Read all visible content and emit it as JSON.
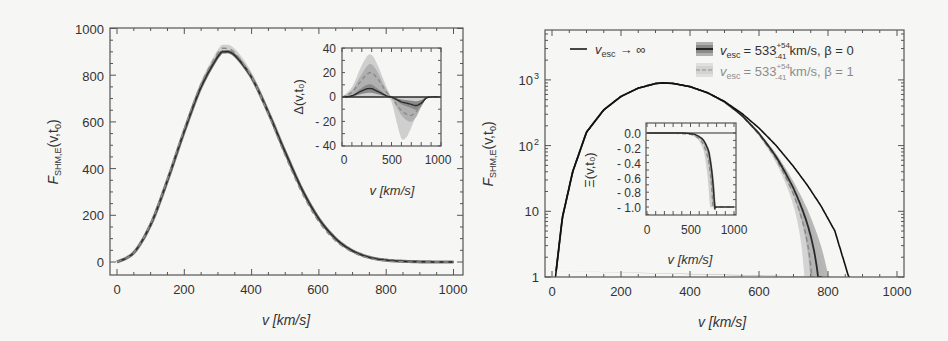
{
  "chart_data": [
    {
      "type": "line",
      "panel": "left",
      "title": "",
      "xlabel": "v [km/s]",
      "ylabel": "F_SHM,E(v,t0)",
      "xlim": [
        -20,
        1030
      ],
      "ylim": [
        -55,
        1000
      ],
      "xticks": [
        0,
        200,
        400,
        600,
        800,
        1000
      ],
      "yticks": [
        0,
        200,
        400,
        600,
        800,
        1000
      ],
      "grid": false,
      "x": [
        0,
        50,
        100,
        150,
        200,
        250,
        300,
        320,
        350,
        400,
        450,
        500,
        550,
        600,
        650,
        700,
        750,
        800,
        850,
        900,
        950,
        1000
      ],
      "series": [
        {
          "name": "v_esc -> inf",
          "style": "solid-dark",
          "values": [
            0,
            40,
            160,
            350,
            560,
            750,
            880,
            900,
            885,
            790,
            640,
            470,
            310,
            185,
            100,
            48,
            20,
            8,
            3,
            1,
            0,
            0
          ]
        },
        {
          "name": "v_esc = 533 km/s, beta = 0 (band)",
          "style": "band-dark",
          "values": [
            0,
            40,
            162,
            354,
            566,
            758,
            890,
            910,
            893,
            795,
            640,
            465,
            303,
            178,
            94,
            44,
            17,
            5,
            1,
            0,
            0,
            0
          ]
        },
        {
          "name": "v_esc = 533 km/s, beta = 1 (dashed)",
          "style": "dashed-light",
          "values": [
            0,
            40,
            163,
            356,
            570,
            763,
            895,
            915,
            896,
            793,
            633,
            455,
            295,
            172,
            90,
            42,
            16,
            4,
            1,
            0,
            0,
            0
          ]
        }
      ],
      "inset": {
        "xlabel": "v [km/s]",
        "ylabel": "Δ(v,t0)",
        "xlim": [
          0,
          1000
        ],
        "ylim": [
          -40,
          40
        ],
        "xticks": [
          0,
          500,
          1000
        ],
        "yticks": [
          -40,
          -20,
          0,
          20,
          40
        ],
        "x": [
          0,
          100,
          200,
          280,
          350,
          450,
          500,
          550,
          600,
          650,
          700,
          750,
          800,
          850,
          900,
          1000
        ],
        "series": [
          {
            "name": "solid beta=0",
            "values": [
              0,
              1,
              5,
              7,
              5,
              1,
              0,
              -2,
              -4,
              -5,
              -6,
              -7,
              -5,
              -1,
              0,
              0
            ]
          },
          {
            "name": "dashed beta=1",
            "values": [
              0,
              4,
              14,
              20,
              16,
              4,
              0,
              -6,
              -11,
              -14,
              -15,
              -12,
              -6,
              -1,
              0,
              0
            ]
          },
          {
            "name": "band upper",
            "values": [
              0,
              8,
              26,
              35,
              28,
              8,
              0,
              0,
              0,
              0,
              0,
              0,
              0,
              0,
              0,
              0
            ]
          },
          {
            "name": "band lower",
            "values": [
              0,
              0,
              0,
              0,
              0,
              0,
              -4,
              -20,
              -34,
              -33,
              -25,
              -15,
              -6,
              -1,
              0,
              0
            ]
          }
        ]
      }
    },
    {
      "type": "line",
      "panel": "right",
      "xlabel": "v [km/s]",
      "ylabel": "F_SHM,E(v,t0)",
      "yscale": "log",
      "xlim": [
        -20,
        1020
      ],
      "ylim": [
        1,
        5800
      ],
      "xticks": [
        0,
        200,
        400,
        600,
        800,
        1000
      ],
      "yticks": [
        "1",
        "10",
        "10²",
        "10³"
      ],
      "legend": [
        {
          "label": "v_esc → ∞",
          "style": "solid-black"
        },
        {
          "label": "v_esc = 533 (+54/-41) km/s, β = 0",
          "style": "band-dark"
        },
        {
          "label": "v_esc = 533 (+54/-41) km/s, β = 1",
          "style": "band-light-dashed"
        }
      ],
      "x": [
        10,
        30,
        60,
        100,
        150,
        200,
        250,
        300,
        320,
        350,
        400,
        450,
        500,
        550,
        600,
        650,
        700,
        740,
        780,
        820,
        860
      ],
      "series": [
        {
          "name": "v_esc -> inf",
          "values": [
            1,
            8,
            40,
            160,
            350,
            560,
            750,
            880,
            900,
            885,
            790,
            640,
            470,
            310,
            185,
            100,
            48,
            25,
            12,
            5,
            1
          ]
        },
        {
          "name": "beta=0 median",
          "values": [
            1,
            8,
            40,
            160,
            350,
            560,
            750,
            880,
            900,
            885,
            790,
            640,
            465,
            300,
            170,
            85,
            35,
            12,
            1,
            null,
            null
          ]
        },
        {
          "name": "beta=1 median",
          "values": [
            1,
            8,
            40,
            160,
            350,
            560,
            750,
            880,
            900,
            885,
            790,
            635,
            455,
            290,
            160,
            75,
            28,
            7,
            null,
            null,
            null
          ]
        }
      ],
      "inset": {
        "xlabel": "v [km/s]",
        "ylabel": "Ξ(v,t0)",
        "xlim": [
          0,
          1000
        ],
        "ylim": [
          -1.05,
          0.1
        ],
        "xticks": [
          0,
          500,
          1000
        ],
        "yticks": [
          "0.0",
          "-0.2",
          "-0.4",
          "-0.6",
          "-0.8",
          "-1.0"
        ],
        "x": [
          0,
          200,
          400,
          500,
          550,
          600,
          650,
          700,
          720,
          740,
          760,
          780,
          800,
          1000
        ],
        "series": [
          {
            "name": "solid beta=0",
            "values": [
              0,
              0,
              0,
              -0.01,
              -0.02,
              -0.05,
              -0.1,
              -0.22,
              -0.32,
              -0.48,
              -0.7,
              -1.0,
              -1.0,
              -1.0
            ]
          },
          {
            "name": "dashed beta=1",
            "values": [
              0,
              0,
              -0.01,
              -0.02,
              -0.04,
              -0.08,
              -0.16,
              -0.34,
              -0.48,
              -0.7,
              -1.0,
              -1.0,
              -1.0,
              -1.0
            ]
          }
        ]
      }
    }
  ],
  "labels": {
    "left": {
      "xlabel": "v [km/s]",
      "ylabel_main": "F",
      "ylabel_sub": "SHM,E",
      "ylabel_args": "(v,t",
      "ylabel_argsub": "0",
      "ylabel_close": ")",
      "xticks": [
        "0",
        "200",
        "400",
        "600",
        "800",
        "1000"
      ],
      "yticks": [
        "0",
        "200",
        "400",
        "600",
        "800",
        "1000"
      ],
      "inset_xlabel": "v [km/s]",
      "inset_ylabel": "Δ(v,t₀)",
      "inset_xticks": [
        "0",
        "500",
        "1000"
      ],
      "inset_yticks": [
        "40",
        "20",
        "0",
        "- 20",
        "- 40"
      ]
    },
    "right": {
      "xlabel": "v [km/s]",
      "xticks": [
        "0",
        "200",
        "400",
        "600",
        "800",
        "1000"
      ],
      "yticks": [
        "1",
        "10",
        "10",
        "10"
      ],
      "yticks_exp": [
        "",
        "",
        "2",
        "3"
      ],
      "inset_xlabel": "v [km/s]",
      "inset_ylabel": "Ξ(v,t₀)",
      "inset_xticks": [
        "0",
        "500",
        "1000"
      ],
      "inset_yticks": [
        "0.0",
        "- 0.2",
        "- 0.4",
        "- 0.6",
        "- 0.8",
        "- 1.0"
      ],
      "legend_inf_v": "v",
      "legend_inf_sub": "esc",
      "legend_inf_rest": "→ ∞",
      "legend_b0_v": "v",
      "legend_b0_sub": "esc",
      "legend_b0_eq": "= 533",
      "legend_b0_sup": "+54",
      "legend_b0_lo": "-41",
      "legend_b0_rest": "km/s, β = 0",
      "legend_b1_v": "v",
      "legend_b1_sub": "esc",
      "legend_b1_eq": "= 533",
      "legend_b1_sup": "+54",
      "legend_b1_lo": "-41",
      "legend_b1_rest": "km/s, β = 1"
    }
  },
  "colors": {
    "dark": "#2a2a2a",
    "band_dark": "#8a8a8a",
    "band_mid": "#b0b0b0",
    "band_light": "#cfcfcf",
    "dashed": "#8c8c8c",
    "background": "#f6f6f4"
  }
}
